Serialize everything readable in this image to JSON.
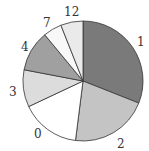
{
  "chart_data": {
    "type": "pie",
    "title": "",
    "start_angle_deg": 0,
    "direction": "clockwise",
    "categories": [
      "1",
      "2",
      "0",
      "3",
      "4",
      "7",
      "12"
    ],
    "values": [
      31,
      21,
      16,
      10,
      11,
      5,
      6
    ],
    "colors": [
      "#7a7a7a",
      "#c4c4c4",
      "#ffffff",
      "#dcdcdc",
      "#a0a0a0",
      "#f8f8f8",
      "#eaeaea"
    ],
    "legend": "none",
    "labels_outside": true
  },
  "labels": [
    {
      "text": "1",
      "x": 137,
      "y": 36
    },
    {
      "text": "2",
      "x": 117,
      "y": 138
    },
    {
      "text": "0",
      "x": 34,
      "y": 128
    },
    {
      "text": "3",
      "x": 9,
      "y": 86
    },
    {
      "text": "4",
      "x": 21,
      "y": 41
    },
    {
      "text": "7",
      "x": 43,
      "y": 17
    },
    {
      "text": "12",
      "x": 64,
      "y": 6
    }
  ]
}
